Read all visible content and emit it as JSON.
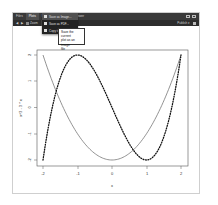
{
  "tabs": [
    {
      "label": "Files",
      "active": false
    },
    {
      "label": "Plots",
      "active": true
    },
    {
      "label": "Packages",
      "active": false
    },
    {
      "label": "Help",
      "active": false
    },
    {
      "label": "Viewer",
      "active": false
    }
  ],
  "toolbar": {
    "zoom_label": "Zoom",
    "export_label": "Export ▾",
    "publish_label": "Publish ▾"
  },
  "export_menu": {
    "items": [
      {
        "label": "Save as Image...",
        "highlighted": true
      },
      {
        "label": "Save as PDF...",
        "highlighted": false
      },
      {
        "label": "Copy to Clipboard...",
        "highlighted": false
      }
    ]
  },
  "tooltip": {
    "line1": "Save the current",
    "line2": "plot as an image",
    "line3": "file"
  },
  "chart_data": {
    "type": "line",
    "title": "",
    "xlabel": "x",
    "ylabel": "x^3 - 3 * x",
    "xlim": [
      -2,
      2
    ],
    "ylim": [
      -2,
      2
    ],
    "x_ticks": [
      "-2",
      "-1",
      "0",
      "1",
      "2"
    ],
    "y_ticks": [
      "2",
      "1",
      "0",
      "-1",
      "-2"
    ],
    "grid": false,
    "series": [
      {
        "name": "x^3 - 3 * x",
        "style": "dotted",
        "x": [
          -2,
          -1.5,
          -1,
          -0.5,
          0,
          0.5,
          1,
          1.5,
          2
        ],
        "values": [
          -2,
          1.125,
          2,
          1.375,
          0,
          -1.375,
          -2,
          -1.125,
          2
        ]
      },
      {
        "name": "x^2 - 2",
        "style": "solid",
        "x": [
          -2,
          -1.5,
          -1,
          -0.5,
          0,
          0.5,
          1,
          1.5,
          2
        ],
        "values": [
          2,
          0.25,
          -1,
          -1.75,
          -2,
          -1.75,
          -1,
          0.25,
          2
        ]
      }
    ]
  }
}
